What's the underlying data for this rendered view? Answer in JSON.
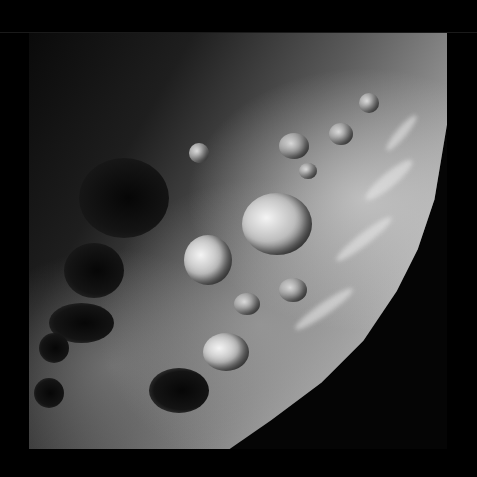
{
  "image": {
    "subject": "cratered moon surface",
    "mode": "grayscale",
    "background_color": "#000000",
    "frame": {
      "left": 29,
      "top": 33,
      "width": 418,
      "height": 416
    }
  },
  "features": {
    "craters_bright": [
      {
        "name": "large-central-crater",
        "x": 213,
        "y": 160,
        "w": 70,
        "h": 62
      },
      {
        "name": "left-central-crater",
        "x": 155,
        "y": 202,
        "w": 48,
        "h": 50
      },
      {
        "name": "lower-crater",
        "x": 174,
        "y": 300,
        "w": 46,
        "h": 38
      }
    ],
    "craters_dark": [
      {
        "name": "dark-crater-upper-left",
        "x": 50,
        "y": 125,
        "w": 90,
        "h": 80
      },
      {
        "name": "dark-crater-left",
        "x": 35,
        "y": 210,
        "w": 60,
        "h": 55
      },
      {
        "name": "dark-crater-lower-left-1",
        "x": 20,
        "y": 270,
        "w": 65,
        "h": 40
      },
      {
        "name": "dark-crater-lower-left-2",
        "x": 10,
        "y": 300,
        "w": 30,
        "h": 30
      },
      {
        "name": "dark-crater-lower-left-3",
        "x": 5,
        "y": 345,
        "w": 30,
        "h": 30
      },
      {
        "name": "dark-crater-bottom",
        "x": 120,
        "y": 335,
        "w": 60,
        "h": 45
      }
    ],
    "craters_mid": [
      {
        "name": "small-crater-1",
        "x": 250,
        "y": 100,
        "w": 30,
        "h": 26
      },
      {
        "name": "small-crater-2",
        "x": 300,
        "y": 90,
        "w": 24,
        "h": 22
      },
      {
        "name": "small-crater-3",
        "x": 330,
        "y": 60,
        "w": 20,
        "h": 20
      },
      {
        "name": "small-crater-4",
        "x": 270,
        "y": 130,
        "w": 18,
        "h": 16
      },
      {
        "name": "small-crater-5",
        "x": 205,
        "y": 260,
        "w": 26,
        "h": 22
      },
      {
        "name": "small-crater-6",
        "x": 250,
        "y": 245,
        "w": 28,
        "h": 24
      },
      {
        "name": "small-crater-7",
        "x": 160,
        "y": 110,
        "w": 20,
        "h": 20
      }
    ],
    "streaks": [
      {
        "name": "limb-streak-1",
        "x": 330,
        "y": 140,
        "w": 60,
        "h": 14,
        "rot": -40
      },
      {
        "name": "limb-streak-2",
        "x": 300,
        "y": 200,
        "w": 70,
        "h": 12,
        "rot": -38
      },
      {
        "name": "limb-streak-3",
        "x": 260,
        "y": 270,
        "w": 70,
        "h": 12,
        "rot": -35
      },
      {
        "name": "limb-streak-4",
        "x": 350,
        "y": 95,
        "w": 45,
        "h": 10,
        "rot": -50
      }
    ]
  }
}
